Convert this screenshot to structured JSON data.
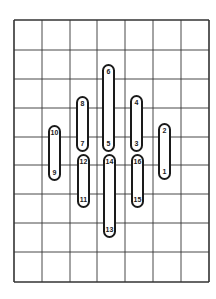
{
  "diagram": {
    "grid": {
      "cols": 7,
      "rows": 9,
      "x_lines": [
        14,
        42,
        70,
        97,
        125,
        153,
        181,
        209
      ],
      "y_lines": [
        20,
        50,
        79,
        108,
        137,
        165,
        194,
        223,
        252,
        282
      ],
      "line_color": "#333333"
    },
    "pills": [
      {
        "top_label": "10",
        "bottom_label": "9",
        "x": 48,
        "y": 125,
        "h": 56
      },
      {
        "top_label": "8",
        "bottom_label": "7",
        "x": 76,
        "y": 96,
        "h": 56
      },
      {
        "top_label": "6",
        "bottom_label": "5",
        "x": 102,
        "y": 64,
        "h": 88
      },
      {
        "top_label": "4",
        "bottom_label": "3",
        "x": 130,
        "y": 95,
        "h": 57
      },
      {
        "top_label": "2",
        "bottom_label": "1",
        "x": 158,
        "y": 123,
        "h": 57
      },
      {
        "top_label": "12",
        "bottom_label": "11",
        "x": 77,
        "y": 154,
        "h": 54
      },
      {
        "top_label": "14",
        "bottom_label": "13",
        "x": 103,
        "y": 154,
        "h": 84
      },
      {
        "top_label": "16",
        "bottom_label": "15",
        "x": 131,
        "y": 154,
        "h": 54
      }
    ]
  }
}
